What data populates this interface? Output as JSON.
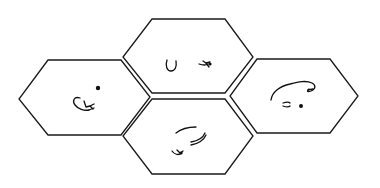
{
  "diagram": {
    "background": "#ffffff",
    "stroke_color": "#1a1a1a",
    "hexagons": [
      {
        "id": "left",
        "points": "48,60 121,60 150,97 121,135 48,135 19,99"
      },
      {
        "id": "top",
        "points": "152,19 225,19 253,57 225,93 152,93 123,57"
      },
      {
        "id": "bottom",
        "points": "152,99 225,99 253,136 225,174 152,174 123,136"
      },
      {
        "id": "right",
        "points": "257,59 330,59 358,96 330,133 257,133 230,96"
      }
    ],
    "sketches": {
      "left": [
        "curled-figure",
        "dot"
      ],
      "top": [
        "u-shape",
        "small-figure"
      ],
      "bottom": [
        "arc-strokes",
        "small-figure"
      ],
      "right": [
        "rounded-outline",
        "small-mark",
        "dot"
      ]
    }
  }
}
